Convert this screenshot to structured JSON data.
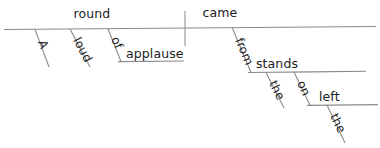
{
  "diagram": {
    "type": "reed-kellogg-sentence-diagram",
    "sentence": "A loud round of applause came from stands on the left.",
    "colors": {
      "line": "#8a8a8a",
      "divider": "#9a9a9a",
      "text": "#1c1c1c",
      "background": "#ffffff"
    },
    "words": {
      "subject": "round",
      "verb": "came",
      "article_a": "A",
      "adjective_loud": "loud",
      "preposition_of": "of",
      "object_of_preposition_applause": "applause",
      "preposition_from": "from",
      "object_of_preposition_stands": "stands",
      "article_the_stands": "the",
      "preposition_on": "on",
      "object_of_preposition_left": "left",
      "article_the_left": "the"
    }
  }
}
